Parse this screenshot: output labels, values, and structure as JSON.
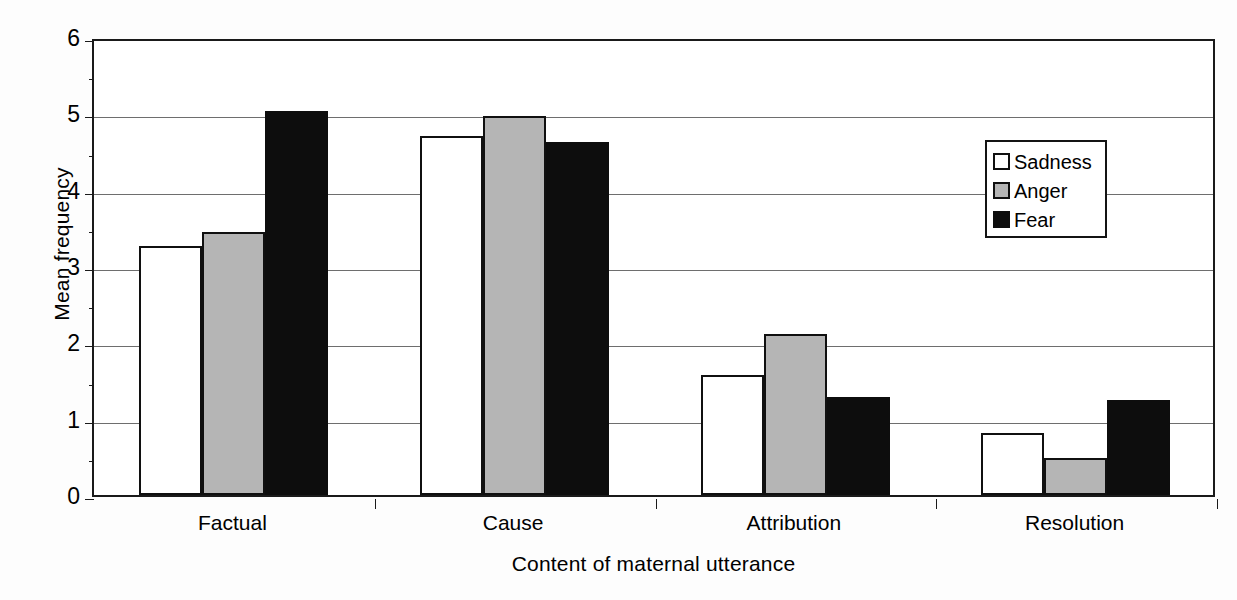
{
  "chart_data": {
    "type": "bar",
    "title": "",
    "xlabel": "Content of maternal utterance",
    "ylabel": "Mean frequency",
    "categories": [
      "Factual",
      "Cause",
      "Attribution",
      "Resolution"
    ],
    "series": [
      {
        "name": "Sadness",
        "color": "#ffffff",
        "values": [
          3.26,
          4.7,
          1.57,
          0.81
        ]
      },
      {
        "name": "Anger",
        "color": "#b5b5b5",
        "values": [
          3.44,
          4.96,
          2.11,
          0.48
        ]
      },
      {
        "name": "Fear",
        "color": "#0d0d0d",
        "values": [
          5.03,
          4.63,
          1.28,
          1.24
        ]
      }
    ],
    "ylim": [
      0,
      6
    ],
    "yticks": [
      0,
      1,
      2,
      3,
      4,
      5,
      6
    ],
    "ytick_labels": [
      "0",
      "1",
      "2",
      "3",
      "4",
      "5",
      "6"
    ],
    "grid": true,
    "legend_position": "upper-right",
    "legend_entries": [
      "Sadness",
      "Anger",
      "Fear"
    ]
  },
  "axes": {
    "y_title": "Mean frequency",
    "x_title": "Content of maternal utterance"
  },
  "legend": {
    "items": [
      {
        "label": "Sadness"
      },
      {
        "label": "Anger"
      },
      {
        "label": "Fear"
      }
    ]
  }
}
